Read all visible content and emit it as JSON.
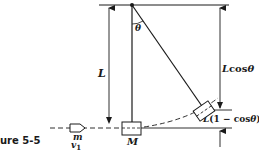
{
  "figure": {
    "caption": "ure 5-5",
    "labels": {
      "length": "L",
      "angle": "θ",
      "vertical_component_L": "L",
      "vertical_component_cos": "cos",
      "vertical_component_theta": "θ",
      "rise_L": "L",
      "rise_open": "(1 − ",
      "rise_cos": "cos",
      "rise_theta": "θ",
      "rise_close": ")",
      "bullet_mass": "m",
      "bullet_velocity": "v",
      "bullet_velocity_sub": "1",
      "block_mass": "M"
    },
    "colors": {
      "ink": "#1a1a1a",
      "background": "#ffffff"
    }
  }
}
